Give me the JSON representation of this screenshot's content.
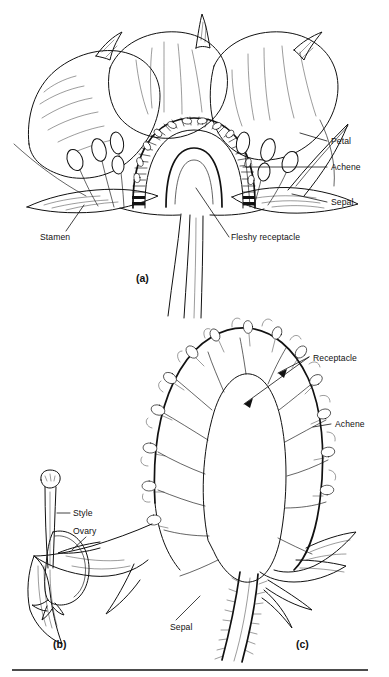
{
  "figure": {
    "background_color": "#ffffff",
    "ink_color": "#111111",
    "width": 389,
    "height": 677
  },
  "panels": [
    {
      "id": "a",
      "panel_label": "(a)",
      "caption": "Longitudinal section of strawberry flower",
      "labels": [
        {
          "key": "petal",
          "text": "Petal"
        },
        {
          "key": "achene",
          "text": "Achene"
        },
        {
          "key": "sepal",
          "text": "Sepal"
        },
        {
          "key": "stamen",
          "text": "Stamen"
        },
        {
          "key": "fleshy_receptacle",
          "text": "Fleshy receptacle"
        }
      ]
    },
    {
      "id": "b",
      "panel_label": "(b)",
      "caption": "Single pistil detail",
      "labels": [
        {
          "key": "style",
          "text": "Style"
        },
        {
          "key": "ovary",
          "text": "Ovary"
        }
      ]
    },
    {
      "id": "c",
      "panel_label": "(c)",
      "caption": "Longitudinal section of developing fruit",
      "labels": [
        {
          "key": "receptacle",
          "text": "Receptacle"
        },
        {
          "key": "achene",
          "text": "Achene"
        },
        {
          "key": "sepal",
          "text": "Sepal"
        }
      ]
    }
  ],
  "labels": {
    "petal": "Petal",
    "achene_a": "Achene",
    "sepal_a": "Sepal",
    "stamen": "Stamen",
    "fleshy_receptacle": "Fleshy receptacle",
    "panel_a": "(a)",
    "style": "Style",
    "ovary": "Ovary",
    "panel_b": "(b)",
    "receptacle": "Receptacle",
    "achene_c": "Achene",
    "sepal_c": "Sepal",
    "panel_c": "(c)"
  }
}
